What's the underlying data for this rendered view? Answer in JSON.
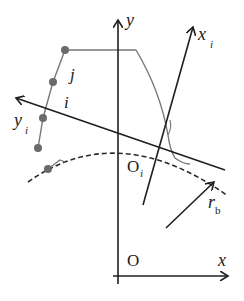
{
  "diagram": {
    "type": "gear tooth coordinate system",
    "colors": {
      "axis": "#1f1f1f",
      "profile": "#6e6e6e",
      "point": "#6a6a6a",
      "base_circle": "#2a2a2a"
    },
    "axes": {
      "y_label": "y",
      "x_label": "x",
      "origin_label": "O",
      "xi_label": "x",
      "xi_sub": "i",
      "yi_label": "y",
      "yi_sub": "i",
      "oi_label": "O",
      "oi_sub": "i"
    },
    "points": {
      "i_label": "i",
      "j_label": "j"
    },
    "base_radius": {
      "label": "r",
      "sub": "b"
    }
  }
}
